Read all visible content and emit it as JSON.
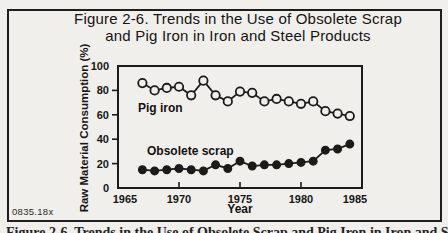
{
  "figure": {
    "title_line1": "Figure 2-6. Trends in the Use of Obsolete Scrap",
    "title_line2": "and Pig Iron in Iron and Steel Products",
    "plate_code": "0835.18x",
    "caption_below": "Figure 2-6. Trends in the Use of Obsolete Scrap and Pig Iron in Iron and Steel Products"
  },
  "colors": {
    "ink": "#1b1b1b",
    "paper": "#f1efeb"
  },
  "chart_data": {
    "type": "line",
    "title": "Trends in the Use of Obsolete Scrap and Pig Iron in Iron and Steel Products",
    "xlabel": "Year",
    "ylabel": "Raw Material Consumption (%)",
    "xlim": [
      1965,
      1985
    ],
    "ylim": [
      0,
      100
    ],
    "x_ticks": [
      1965,
      1970,
      1975,
      1980,
      1985
    ],
    "y_ticks": [
      0,
      20,
      40,
      60,
      80,
      100
    ],
    "grid": false,
    "legend_position": "inline-labels",
    "x": [
      1967,
      1968,
      1969,
      1970,
      1971,
      1972,
      1973,
      1974,
      1975,
      1976,
      1977,
      1978,
      1979,
      1980,
      1981,
      1982,
      1983,
      1984
    ],
    "series": [
      {
        "name": "Pig iron",
        "marker": "open-circle",
        "values": [
          86,
          80,
          82,
          83,
          76,
          88,
          76,
          71,
          79,
          78,
          71,
          73,
          71,
          69,
          71,
          63,
          61,
          59
        ]
      },
      {
        "name": "Obsolete scrap",
        "marker": "filled-circle",
        "values": [
          15,
          14,
          15,
          16,
          15,
          14,
          19,
          16,
          22,
          18,
          19,
          19,
          20,
          21,
          22,
          31,
          32,
          36
        ]
      }
    ]
  }
}
